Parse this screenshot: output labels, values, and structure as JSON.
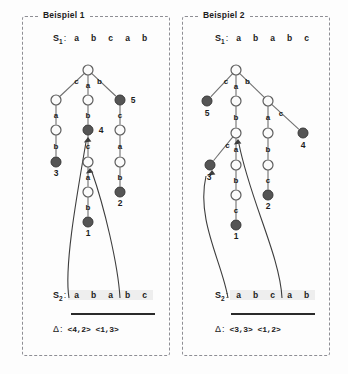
{
  "figure": {
    "background": "#fdfdfd",
    "node_open_color": "#fbfbfb",
    "node_filled_color": "#555555",
    "edge_color": "#6f6f6f"
  },
  "panels": [
    {
      "title": "Beispiel 1",
      "s1": {
        "label": "S",
        "sub": "1",
        "colon": ":",
        "chars": [
          "a",
          "b",
          "c",
          "a",
          "b"
        ]
      },
      "s2": {
        "label": "S",
        "sub": "2",
        "colon": ":",
        "chars": [
          "a",
          "b",
          "a",
          "b",
          "c"
        ]
      },
      "delta": {
        "symbol": "Δ",
        "colon": ":",
        "values": [
          "<4,2>",
          "<1,3>"
        ]
      },
      "tree": {
        "nodes": [
          {
            "id": "root",
            "x": 88,
            "y": 70,
            "filled": false,
            "r": 5.0,
            "label": "",
            "num": ""
          },
          {
            "id": "n-c",
            "x": 56,
            "y": 100,
            "filled": false,
            "r": 5.0,
            "label": "c",
            "num": ""
          },
          {
            "id": "n-a",
            "x": 88,
            "y": 100,
            "filled": false,
            "r": 5.0,
            "label": "a",
            "num": ""
          },
          {
            "id": "n-b5",
            "x": 120,
            "y": 100,
            "filled": true,
            "r": 5.0,
            "label": "b",
            "num": "5"
          },
          {
            "id": "n-ca",
            "x": 56,
            "y": 130,
            "filled": false,
            "r": 5.0,
            "label": "a",
            "num": ""
          },
          {
            "id": "n-ab4",
            "x": 88,
            "y": 130,
            "filled": true,
            "r": 5.0,
            "label": "b",
            "num": "4"
          },
          {
            "id": "n-bc",
            "x": 120,
            "y": 130,
            "filled": false,
            "r": 5.0,
            "label": "c",
            "num": ""
          },
          {
            "id": "n-cab3",
            "x": 56,
            "y": 162,
            "filled": true,
            "r": 5.0,
            "label": "b",
            "num": "3"
          },
          {
            "id": "n-abc",
            "x": 88,
            "y": 162,
            "filled": false,
            "r": 5.0,
            "label": "c",
            "num": ""
          },
          {
            "id": "n-bca",
            "x": 120,
            "y": 162,
            "filled": false,
            "r": 5.0,
            "label": "a",
            "num": ""
          },
          {
            "id": "n-abca",
            "x": 88,
            "y": 192,
            "filled": false,
            "r": 5.0,
            "label": "a",
            "num": ""
          },
          {
            "id": "n-bcab2",
            "x": 120,
            "y": 192,
            "filled": true,
            "r": 5.0,
            "label": "b",
            "num": "2"
          },
          {
            "id": "n-abcab1",
            "x": 88,
            "y": 222,
            "filled": true,
            "r": 5.0,
            "label": "b",
            "num": "1"
          }
        ],
        "edges": [
          {
            "from": "root",
            "to": "n-c"
          },
          {
            "from": "root",
            "to": "n-a"
          },
          {
            "from": "root",
            "to": "n-b5"
          },
          {
            "from": "n-c",
            "to": "n-ca"
          },
          {
            "from": "n-a",
            "to": "n-ab4"
          },
          {
            "from": "n-b5",
            "to": "n-bc"
          },
          {
            "from": "n-ca",
            "to": "n-cab3"
          },
          {
            "from": "n-ab4",
            "to": "n-abc"
          },
          {
            "from": "n-bc",
            "to": "n-bca"
          },
          {
            "from": "n-abc",
            "to": "n-abca"
          },
          {
            "from": "n-bca",
            "to": "n-bcab2"
          },
          {
            "from": "n-abca",
            "to": "n-abcab1"
          }
        ],
        "links": [
          {
            "name": "suffix-link-1",
            "path": "M 69 298 C 64 268 76 200 86 142",
            "target_x": 88,
            "target_y": 137
          },
          {
            "name": "suffix-link-2",
            "path": "M 120 298 C 118 264 104 206 92 172",
            "target_x": 90,
            "target_y": 168
          }
        ]
      }
    },
    {
      "title": "Beispiel 2",
      "s1": {
        "label": "S",
        "sub": "1",
        "colon": ":",
        "chars": [
          "a",
          "b",
          "a",
          "b",
          "c"
        ]
      },
      "s2": {
        "label": "S",
        "sub": "2",
        "colon": ":",
        "chars": [
          "a",
          "b",
          "c",
          "a",
          "b"
        ]
      },
      "delta": {
        "symbol": "Δ",
        "colon": ":",
        "values": [
          "<3,3>",
          "<1,2>"
        ]
      },
      "tree": {
        "nodes": [
          {
            "id": "root2",
            "x": 236,
            "y": 70,
            "filled": false,
            "r": 5.0,
            "label": "",
            "num": ""
          },
          {
            "id": "m-c5",
            "x": 207,
            "y": 101,
            "filled": true,
            "r": 5.0,
            "label": "c",
            "num": "5"
          },
          {
            "id": "m-a",
            "x": 236,
            "y": 101,
            "filled": false,
            "r": 5.0,
            "label": "a",
            "num": ""
          },
          {
            "id": "m-b",
            "x": 268,
            "y": 101,
            "filled": false,
            "r": 5.0,
            "label": "b",
            "num": ""
          },
          {
            "id": "m-ab",
            "x": 236,
            "y": 133,
            "filled": false,
            "r": 5.0,
            "label": "b",
            "num": ""
          },
          {
            "id": "m-ba",
            "x": 268,
            "y": 133,
            "filled": false,
            "r": 5.0,
            "label": "a",
            "num": ""
          },
          {
            "id": "m-bc4",
            "x": 303,
            "y": 133,
            "filled": true,
            "r": 5.0,
            "label": "c",
            "num": "4"
          },
          {
            "id": "m-abc3",
            "x": 210,
            "y": 165,
            "filled": true,
            "r": 5.0,
            "label": "c",
            "num": "3"
          },
          {
            "id": "m-aba",
            "x": 236,
            "y": 165,
            "filled": false,
            "r": 5.0,
            "label": "a",
            "num": ""
          },
          {
            "id": "m-bab",
            "x": 268,
            "y": 165,
            "filled": false,
            "r": 5.0,
            "label": "b",
            "num": ""
          },
          {
            "id": "m-abab",
            "x": 236,
            "y": 195,
            "filled": false,
            "r": 5.0,
            "label": "b",
            "num": ""
          },
          {
            "id": "m-babc2",
            "x": 268,
            "y": 195,
            "filled": true,
            "r": 5.0,
            "label": "c",
            "num": "2"
          },
          {
            "id": "m-ababc1",
            "x": 236,
            "y": 225,
            "filled": true,
            "r": 5.0,
            "label": "c",
            "num": "1"
          }
        ],
        "edges": [
          {
            "from": "root2",
            "to": "m-c5"
          },
          {
            "from": "root2",
            "to": "m-a"
          },
          {
            "from": "root2",
            "to": "m-b"
          },
          {
            "from": "m-a",
            "to": "m-ab"
          },
          {
            "from": "m-b",
            "to": "m-ba"
          },
          {
            "from": "m-b",
            "to": "m-bc4"
          },
          {
            "from": "m-ab",
            "to": "m-abc3"
          },
          {
            "from": "m-ab",
            "to": "m-aba"
          },
          {
            "from": "m-ba",
            "to": "m-bab"
          },
          {
            "from": "m-aba",
            "to": "m-abab"
          },
          {
            "from": "m-bab",
            "to": "m-babc2"
          },
          {
            "from": "m-abab",
            "to": "m-ababc1"
          }
        ],
        "links": [
          {
            "name": "suffix-link-1",
            "path": "M 228 298 C 222 262 196 220 206 176",
            "target_x": 212,
            "target_y": 170
          },
          {
            "name": "suffix-link-2",
            "path": "M 282 298 C 280 256 250 200 239 144",
            "target_x": 238,
            "target_y": 139
          }
        ]
      }
    }
  ]
}
